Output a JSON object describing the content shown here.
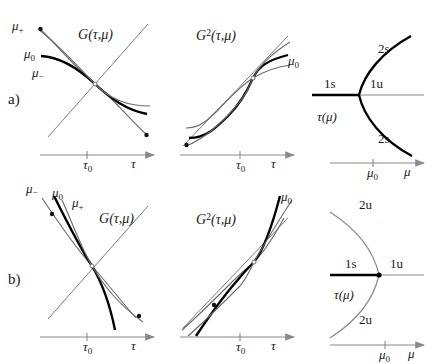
{
  "figure": {
    "caption_letters": {
      "a": "a)",
      "b": "b)"
    },
    "colors": {
      "ink": "#1a1a1a",
      "thick_curve": "#000000",
      "thin_curve": "#5a5a5a",
      "axis": "#8a8a8a",
      "background": "#ffffff"
    }
  },
  "row_a": {
    "letter": "a)",
    "panel_map": {
      "title_base": "G",
      "title_args": "(τ,μ)",
      "curve_labels": [
        {
          "base": "μ",
          "sub": "+"
        },
        {
          "base": "μ",
          "sub": "0"
        },
        {
          "base": "μ",
          "sub": "−"
        }
      ],
      "axis_x_label": "τ",
      "axis_tick_label": {
        "base": "τ",
        "sub": "0"
      },
      "description": "decreasing return map crossing diagonal"
    },
    "panel_map2": {
      "title_base": "G",
      "title_sup": "2",
      "title_args": "(τ,μ)",
      "curve_labels": [
        {
          "base": "μ",
          "sub": "0"
        }
      ],
      "axis_x_label": "τ",
      "axis_tick_label": {
        "base": "τ",
        "sub": "0"
      },
      "description": "second iterate, increasing, single crossing"
    },
    "panel_bif": {
      "y_label": {
        "base": "τ",
        "args": "(μ)"
      },
      "axis_x_label": "μ",
      "axis_tick_label": {
        "base": "μ",
        "sub": "0"
      },
      "branches": [
        {
          "name": "2s",
          "position": "upper-right"
        },
        {
          "name": "1s",
          "position": "left"
        },
        {
          "name": "1u",
          "position": "right"
        },
        {
          "name": "2s",
          "position": "lower-right"
        }
      ],
      "description": "supercritical pitchfork, stable period-2 branches open right"
    }
  },
  "row_b": {
    "letter": "b)",
    "panel_map": {
      "title_base": "G",
      "title_args": "(τ,μ)",
      "curve_labels": [
        {
          "base": "μ",
          "sub": "−"
        },
        {
          "base": "μ",
          "sub": "0"
        },
        {
          "base": "μ",
          "sub": "+"
        }
      ],
      "axis_x_label": "τ",
      "axis_tick_label": {
        "base": "τ",
        "sub": "0"
      },
      "description": "steeper decreasing return map crossing diagonal"
    },
    "panel_map2": {
      "title_base": "G",
      "title_sup": "2",
      "title_args": "(τ,μ)",
      "curve_labels": [
        {
          "base": "μ",
          "sub": "0"
        }
      ],
      "axis_x_label": "τ",
      "axis_tick_label": {
        "base": "τ",
        "sub": "0"
      },
      "description": "second iterate, steeply increasing, single crossing"
    },
    "panel_bif": {
      "y_label": {
        "base": "τ",
        "args": "(μ)"
      },
      "axis_x_label": "μ",
      "axis_tick_label": {
        "base": "μ",
        "sub": "0"
      },
      "branches": [
        {
          "name": "2u",
          "position": "upper-left"
        },
        {
          "name": "1s",
          "position": "left"
        },
        {
          "name": "1u",
          "position": "right"
        },
        {
          "name": "2u",
          "position": "lower-left"
        }
      ],
      "description": "subcritical pitchfork, unstable period-2 branches open left"
    }
  }
}
